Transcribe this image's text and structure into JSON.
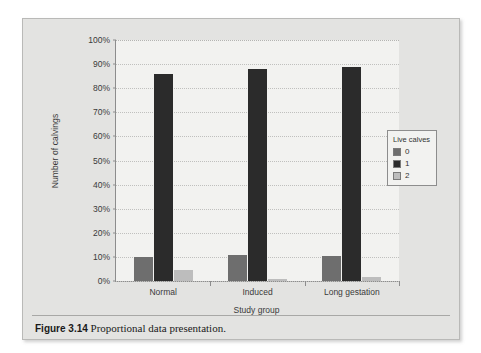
{
  "figure": {
    "caption_label": "Figure 3.14",
    "caption_text": "Proportional data presentation."
  },
  "legend": {
    "title": "Live calves",
    "entries": [
      {
        "label": "0",
        "color": "#6e6e6e"
      },
      {
        "label": "1",
        "color": "#2b2b2b"
      },
      {
        "label": "2",
        "color": "#bdbdbd"
      }
    ]
  },
  "chart_data": {
    "type": "bar",
    "title": "",
    "xlabel": "Study group",
    "ylabel": "Number of calvings",
    "categories": [
      "Normal",
      "Induced",
      "Long gestation"
    ],
    "series": [
      {
        "name": "0",
        "color": "#6e6e6e",
        "values": [
          10,
          11,
          10.5
        ]
      },
      {
        "name": "1",
        "color": "#2b2b2b",
        "values": [
          86,
          88,
          89
        ]
      },
      {
        "name": "2",
        "color": "#bdbdbd",
        "values": [
          4.5,
          1,
          1.5
        ]
      }
    ],
    "ylim": [
      0,
      100
    ],
    "ytick_values": [
      0,
      10,
      20,
      30,
      40,
      50,
      60,
      70,
      80,
      90,
      100
    ],
    "ytick_labels": [
      "0%",
      "10%",
      "20%",
      "30%",
      "40%",
      "50%",
      "60%",
      "70%",
      "80%",
      "90%",
      "100%"
    ],
    "grid": true,
    "legend_position": "right"
  }
}
